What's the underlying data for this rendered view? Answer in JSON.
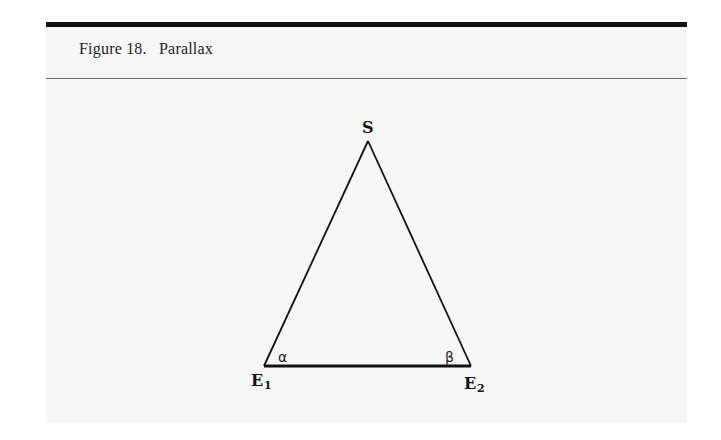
{
  "figure": {
    "number_label": "Figure 18.",
    "title": "Parallax"
  },
  "diagram": {
    "apex_label": "S",
    "left_vertex_label": "E",
    "left_vertex_subscript": "1",
    "right_vertex_label": "E",
    "right_vertex_subscript": "2",
    "left_angle_label": "α",
    "right_angle_label": "β",
    "line_color": "#111111",
    "panel_color": "#f7f7f7"
  }
}
